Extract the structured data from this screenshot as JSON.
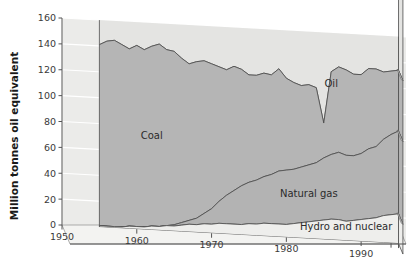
{
  "chart_data": {
    "type": "area",
    "title": "",
    "subtitle": "",
    "xlabel": "",
    "ylabel": "Million tonnes oil equivalent",
    "stacked": true,
    "three_d": true,
    "grid": true,
    "legend_position": "inline-annotations",
    "xlim": [
      1950,
      1996
    ],
    "ylim": [
      0,
      160
    ],
    "xticks": [
      1950,
      1960,
      1970,
      1980,
      1990
    ],
    "xticklabels": [
      "1950",
      "1960",
      "1970",
      "1980",
      "1990"
    ],
    "yticks": [
      0,
      20,
      40,
      60,
      80,
      100,
      120,
      140,
      160
    ],
    "yticklabels": [
      "0",
      "20",
      "40",
      "60",
      "80",
      "100",
      "120",
      "140",
      "160"
    ],
    "x": [
      1955,
      1956,
      1957,
      1958,
      1959,
      1960,
      1961,
      1962,
      1963,
      1964,
      1965,
      1966,
      1967,
      1968,
      1969,
      1970,
      1971,
      1972,
      1973,
      1974,
      1975,
      1976,
      1977,
      1978,
      1979,
      1980,
      1981,
      1982,
      1983,
      1984,
      1985,
      1986,
      1987,
      1988,
      1989,
      1990,
      1991,
      1992,
      1993,
      1994,
      1995
    ],
    "series": [
      {
        "name": "Hydro and nuclear",
        "color": "#eeeeec",
        "values": [
          1,
          1,
          1,
          1,
          2,
          2,
          2,
          3,
          3,
          4,
          4,
          5,
          6,
          6,
          7,
          7,
          8,
          8,
          8,
          8,
          9,
          9,
          10,
          10,
          10,
          10,
          11,
          12,
          13,
          14,
          15,
          16,
          16,
          15,
          16,
          17,
          18,
          19,
          21,
          22,
          23
        ]
      },
      {
        "name": "Natural gas",
        "color": "#b3b3b3",
        "values": [
          0,
          0,
          0,
          0,
          0,
          0,
          0,
          0,
          0,
          0,
          1,
          2,
          3,
          5,
          8,
          12,
          17,
          22,
          26,
          30,
          32,
          34,
          36,
          38,
          41,
          42,
          42,
          43,
          44,
          45,
          48,
          50,
          52,
          51,
          50,
          51,
          54,
          55,
          59,
          62,
          64
        ]
      },
      {
        "name": "Coal",
        "color": "#b5b5b5",
        "values": [
          140,
          143,
          144,
          141,
          137,
          140,
          137,
          139,
          141,
          136,
          134,
          127,
          121,
          121,
          118,
          112,
          104,
          97,
          96,
          90,
          83,
          81,
          80,
          77,
          79,
          71,
          67,
          63,
          62,
          58,
          27,
          64,
          66,
          66,
          63,
          61,
          62,
          60,
          52,
          49,
          47
        ]
      },
      {
        "name": "Oil",
        "color": "#e4e4e2",
        "values": [
          22,
          25,
          27,
          29,
          32,
          36,
          40,
          44,
          48,
          54,
          58,
          63,
          69,
          75,
          81,
          89,
          93,
          97,
          103,
          96,
          87,
          86,
          85,
          87,
          89,
          79,
          72,
          68,
          66,
          72,
          78,
          73,
          71,
          72,
          74,
          74,
          76,
          76,
          77,
          78,
          78
        ]
      }
    ],
    "annotations": [
      {
        "text": "Coal",
        "x": 1962,
        "y": 70
      },
      {
        "text": "Oil",
        "x": 1986,
        "y": 118
      },
      {
        "text": "Natural gas",
        "x": 1983,
        "y": 32
      },
      {
        "text": "Hydro and nuclear",
        "x": 1988,
        "y": 8
      }
    ],
    "colors": {
      "coal": "#b5b5b5",
      "oil": "#e4e4e2",
      "natural_gas": "#b3b3b3",
      "hydro_and_nuclear": "#eeeeec",
      "grid": "#ffffff",
      "plot_background": "#ebebe9",
      "axis": "#555555",
      "outline": "#4a4a4a",
      "text": "#3a3a3a"
    }
  }
}
